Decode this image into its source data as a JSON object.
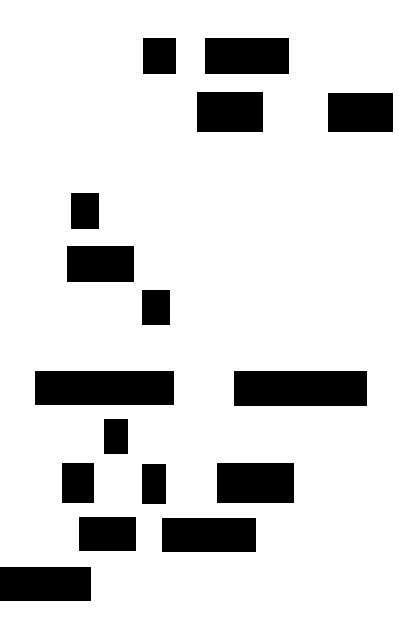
{
  "page": {
    "background": "#ffffff",
    "redaction_color": "#000000"
  },
  "blocks": [
    {
      "x": 143,
      "y": 38,
      "w": 33,
      "h": 36
    },
    {
      "x": 205,
      "y": 38,
      "w": 84,
      "h": 36
    },
    {
      "x": 197,
      "y": 92,
      "w": 66,
      "h": 40
    },
    {
      "x": 328,
      "y": 93,
      "w": 65,
      "h": 39
    },
    {
      "x": 71,
      "y": 193,
      "w": 28,
      "h": 36
    },
    {
      "x": 67,
      "y": 246,
      "w": 67,
      "h": 36
    },
    {
      "x": 142,
      "y": 290,
      "w": 28,
      "h": 35
    },
    {
      "x": 35,
      "y": 371,
      "w": 139,
      "h": 34
    },
    {
      "x": 234,
      "y": 371,
      "w": 133,
      "h": 35
    },
    {
      "x": 104,
      "y": 419,
      "w": 24,
      "h": 35
    },
    {
      "x": 62,
      "y": 463,
      "w": 32,
      "h": 40
    },
    {
      "x": 142,
      "y": 464,
      "w": 24,
      "h": 40
    },
    {
      "x": 217,
      "y": 463,
      "w": 77,
      "h": 40
    },
    {
      "x": 79,
      "y": 517,
      "w": 57,
      "h": 34
    },
    {
      "x": 162,
      "y": 518,
      "w": 94,
      "h": 34
    },
    {
      "x": 0,
      "y": 567,
      "w": 91,
      "h": 34
    }
  ]
}
